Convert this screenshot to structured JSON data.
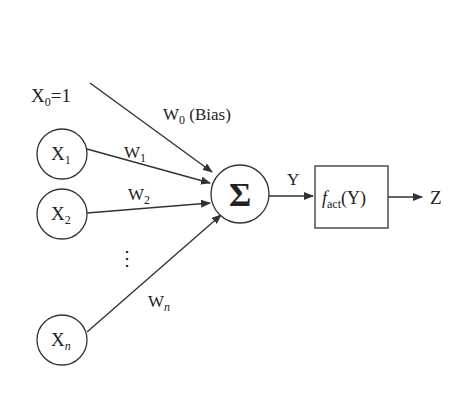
{
  "diagram": {
    "bias_input": {
      "label": "X",
      "sub": "0",
      "suffix": "=1"
    },
    "inputs": [
      {
        "label": "X",
        "sub": "1"
      },
      {
        "label": "X",
        "sub": "2"
      },
      {
        "label": "X",
        "sub": "n"
      }
    ],
    "ellipsis": "⋮",
    "weights": [
      {
        "label": "W",
        "sub": "0",
        "suffix": " (Bias)"
      },
      {
        "label": "W",
        "sub": "1",
        "suffix": ""
      },
      {
        "label": "W",
        "sub": "2",
        "suffix": ""
      },
      {
        "label": "W",
        "sub": "n",
        "suffix": ""
      }
    ],
    "summation": {
      "symbol": "Σ"
    },
    "sum_output": {
      "label": "Y"
    },
    "activation": {
      "f": "f",
      "sub": "act",
      "arg": "(Y)"
    },
    "output": {
      "label": "Z"
    },
    "colors": {
      "stroke": "#333333",
      "text": "#222222",
      "background": "#ffffff"
    }
  }
}
